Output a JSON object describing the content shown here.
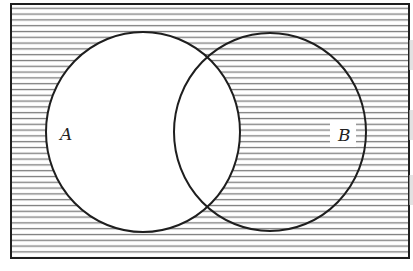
{
  "diagram": {
    "type": "venn",
    "shaded_region": "complement of A",
    "hatch": {
      "color": "#7a7a7a",
      "spacing": 5.8,
      "direction": "horizontal"
    },
    "stroke_color": "#1e1e1e",
    "universe": {
      "x": 11,
      "y": 4,
      "width": 398,
      "height": 254
    },
    "sets": [
      {
        "id": "A",
        "label": "A",
        "cx": 143,
        "cy": 132,
        "rx": 97,
        "ry": 100,
        "label_x": 60,
        "label_y": 140
      },
      {
        "id": "B",
        "label": "B",
        "cx": 270,
        "cy": 132,
        "rx": 96,
        "ry": 99,
        "label_x": 340,
        "label_y": 141
      }
    ]
  }
}
